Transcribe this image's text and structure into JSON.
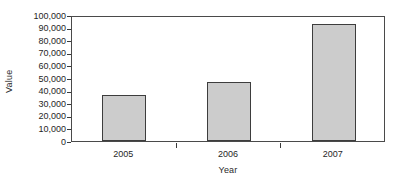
{
  "chart_data": {
    "type": "bar",
    "title": "",
    "subtitle": "",
    "categories": [
      "2005",
      "2006",
      "2007"
    ],
    "values": [
      36500,
      47000,
      93000
    ],
    "series": [
      {
        "name": "Value",
        "values": [
          36500,
          47000,
          93000
        ]
      }
    ],
    "xlabel": "Year",
    "ylabel": "Value",
    "ylim": [
      0,
      100000
    ],
    "ytick_values": [
      0,
      10000,
      20000,
      30000,
      40000,
      50000,
      60000,
      70000,
      80000,
      90000,
      100000
    ],
    "ytick_labels": [
      "0",
      "10,000",
      "20,000",
      "30,000",
      "40,000",
      "50,000",
      "60,000",
      "70,000",
      "80,000",
      "90,000",
      "100,000"
    ],
    "grid": false,
    "legend": false,
    "legend_position": "none",
    "bar_color": "#cccccc",
    "bar_border_color": "#3d3d3d",
    "axis_color": "#4a4a4a",
    "background_color": "#ffffff",
    "annotations": []
  }
}
